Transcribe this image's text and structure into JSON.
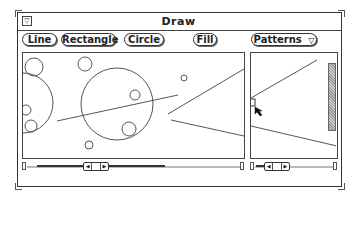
{
  "window": {
    "title": "Draw",
    "menu_icon": "▽"
  },
  "toolbar": {
    "buttons": [
      {
        "label": "Line"
      },
      {
        "label": "Rectangle"
      },
      {
        "label": "Circle"
      },
      {
        "label": "Fill"
      }
    ],
    "patterns_menu": {
      "label": "Patterns",
      "icon": "▽"
    }
  },
  "left_canvas": {
    "circles": [
      {
        "cx": 23,
        "cy": 103,
        "r": 30
      },
      {
        "cx": 34,
        "cy": 67,
        "r": 9
      },
      {
        "cx": 85,
        "cy": 64,
        "r": 7
      },
      {
        "cx": 26,
        "cy": 110,
        "r": 5
      },
      {
        "cx": 31,
        "cy": 126,
        "r": 6
      },
      {
        "cx": 89,
        "cy": 145,
        "r": 4
      },
      {
        "cx": 117,
        "cy": 104,
        "r": 36
      },
      {
        "cx": 135,
        "cy": 95,
        "r": 5
      },
      {
        "cx": 129,
        "cy": 129,
        "r": 7
      },
      {
        "cx": 184,
        "cy": 78,
        "r": 3
      }
    ],
    "lines": [
      {
        "x1": 57,
        "y1": 121,
        "x2": 178,
        "y2": 95
      },
      {
        "x1": 168,
        "y1": 114,
        "x2": 244,
        "y2": 69
      },
      {
        "x1": 171,
        "y1": 120,
        "x2": 244,
        "y2": 136
      }
    ]
  },
  "right_canvas": {
    "lines": [
      {
        "x1": 251,
        "y1": 98,
        "x2": 317,
        "y2": 60
      },
      {
        "x1": 251,
        "y1": 126,
        "x2": 337,
        "y2": 146
      }
    ],
    "pattern_swatch": {
      "x": 328,
      "y": 63,
      "w": 8,
      "h": 68
    }
  },
  "scrollbars": {
    "left": {
      "left_arrow": "◀",
      "right_arrow": "▶"
    },
    "right": {
      "left_arrow": "◀",
      "right_arrow": "▶"
    }
  },
  "cursor": {
    "icon": "arrow-pointer",
    "x": 255,
    "y": 107
  }
}
